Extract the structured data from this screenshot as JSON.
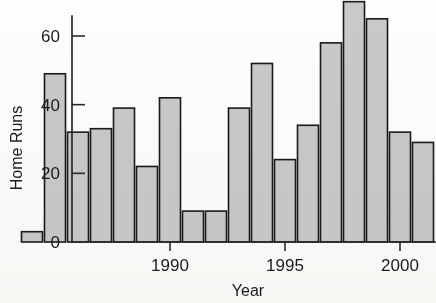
{
  "chart_data": {
    "type": "bar",
    "title": "",
    "subtitle": "",
    "xlabel": "Year",
    "ylabel": "Home Runs",
    "categories": [
      1984,
      1985,
      1986,
      1987,
      1988,
      1989,
      1990,
      1991,
      1992,
      1993,
      1994,
      1995,
      1996,
      1997,
      1998,
      1999,
      2000,
      2001
    ],
    "values": [
      3,
      49,
      32,
      33,
      39,
      22,
      42,
      9,
      9,
      39,
      52,
      24,
      34,
      58,
      70,
      65,
      32,
      29
    ],
    "x": [
      1984,
      1985,
      1986,
      1987,
      1988,
      1989,
      1990,
      1991,
      1992,
      1993,
      1994,
      1995,
      1996,
      1997,
      1998,
      1999,
      2000,
      2001
    ],
    "xlim": [
      1983.5,
      2001.5
    ],
    "ylim": [
      0,
      73
    ],
    "y_ticks": [
      0,
      20,
      40,
      60
    ],
    "y_tick_labels": [
      "0",
      "20",
      "40",
      "60"
    ],
    "x_ticks": [
      1990,
      1995,
      2000
    ],
    "x_tick_labels": [
      "1990",
      "1995",
      "2000"
    ],
    "grid": false,
    "legend": null,
    "legend_position": "none",
    "bar_fill_color": "#c9c9c9",
    "bar_edge_color": "#1a1a1a",
    "axis_color": "#2a2a2a",
    "background_color": "#fdfdfc"
  }
}
